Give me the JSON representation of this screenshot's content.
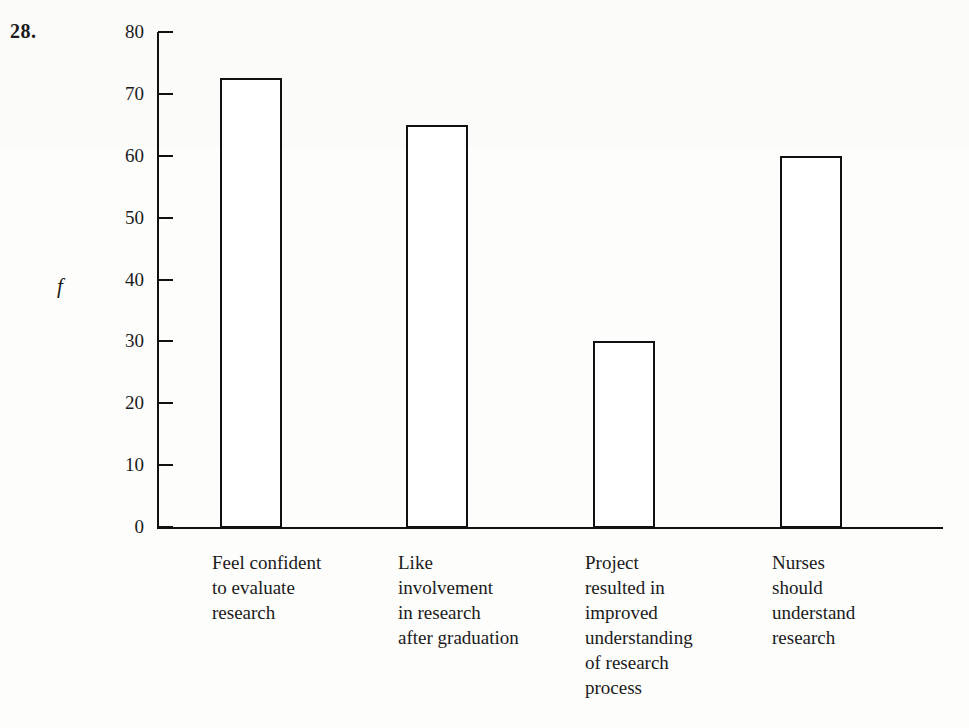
{
  "question_number": "28.",
  "chart_data": {
    "type": "bar",
    "title": "",
    "xlabel": "",
    "ylabel": "f",
    "ylim": [
      0,
      80
    ],
    "ytick_values": [
      0,
      10,
      20,
      30,
      40,
      50,
      60,
      70,
      80
    ],
    "ytick_labels": [
      "0",
      "10",
      "20",
      "30",
      "40",
      "50",
      "60",
      "70",
      "80"
    ],
    "grid": false,
    "legend": false,
    "bar_style": "outlined-unfilled",
    "bar_edge_color": "#111111",
    "bar_fill_color": "#ffffff",
    "categories": [
      "Feel confident\nto evaluate\nresearch",
      "Like\ninvolvement\nin research\nafter graduation",
      "Project\nresulted in\nimproved\nunderstanding\nof research\nprocess",
      "Nurses\nshould\nunderstand\nresearch"
    ],
    "values": [
      72.5,
      65,
      30,
      60
    ]
  }
}
